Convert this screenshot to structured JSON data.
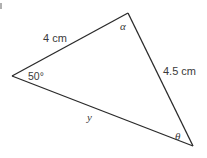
{
  "diagram": {
    "type": "triangle",
    "vertices": {
      "top": {
        "x": 128,
        "y": 13
      },
      "left": {
        "x": 12,
        "y": 76
      },
      "bottom_right": {
        "x": 193,
        "y": 146
      }
    },
    "sides": [
      {
        "id": "top-left",
        "from": "left",
        "to": "top",
        "label": "4 cm"
      },
      {
        "id": "top-right",
        "from": "top",
        "to": "bottom_right",
        "label": "4.5 cm"
      },
      {
        "id": "bottom",
        "from": "left",
        "to": "bottom_right",
        "label": "y"
      }
    ],
    "angles": [
      {
        "vertex": "top",
        "label": "α"
      },
      {
        "vertex": "left",
        "label": "50°"
      },
      {
        "vertex": "bottom_right",
        "label": "θ"
      }
    ],
    "stroke_color": "#2a2a2a",
    "text_color": "#3a3a3a"
  }
}
